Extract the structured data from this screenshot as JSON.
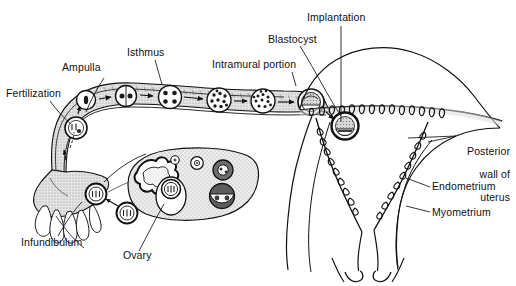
{
  "figure": {
    "background_color": "#ffffff",
    "ink_color": "#111111",
    "tissue_fill": "#e8e8e8",
    "width": 516,
    "height": 286
  },
  "labels": {
    "fertilization": "Fertilization",
    "ampulla": "Ampulla",
    "isthmus": "Isthmus",
    "intramural_portion": "Intramural portion",
    "blastocyst": "Blastocyst",
    "implantation": "Implantation",
    "posterior_wall_of_uterus": "Posterior\nwall of\nuterus",
    "posterior_wall_line1": "Posterior",
    "posterior_wall_line2": "wall of",
    "posterior_wall_line3": "uterus",
    "endometrium": "Endometrium",
    "myometrium": "Myometrium",
    "infundibulum": "Infundibulum",
    "ovary": "Ovary"
  },
  "structures": {
    "fallopian_tube": "fallopian-tube",
    "uterus": "uterus",
    "ovary": "ovary",
    "infundibulum_fimbriae": "infundibulum-fimbriae",
    "endometrial_glands": "endometrial-glands",
    "cervical_canal": "cervical-canal"
  },
  "embryo_stages": [
    {
      "name": "zygote",
      "cells": 1,
      "x": 82,
      "y": 99,
      "r": 9
    },
    {
      "name": "two-cell-stage",
      "cells": 2,
      "x": 124,
      "y": 96,
      "r": 10
    },
    {
      "name": "four-cell-stage",
      "cells": 4,
      "x": 168,
      "y": 97,
      "r": 11
    },
    {
      "name": "morula",
      "cells": 12,
      "x": 218,
      "y": 100,
      "r": 12
    },
    {
      "name": "late-morula",
      "cells": 16,
      "x": 262,
      "y": 101,
      "r": 12
    },
    {
      "name": "free-blastocyst",
      "cells": 0,
      "x": 310,
      "y": 102,
      "r": 13
    },
    {
      "name": "implanting-blastocyst",
      "cells": 0,
      "x": 345,
      "y": 125,
      "r": 13
    }
  ],
  "ovarian_features": [
    {
      "name": "primordial-follicle",
      "x": 175,
      "y": 160,
      "r": 4
    },
    {
      "name": "primary-follicle",
      "x": 196,
      "y": 164,
      "r": 6
    },
    {
      "name": "secondary-follicle",
      "x": 222,
      "y": 170,
      "r": 9
    },
    {
      "name": "graafian-follicle",
      "x": 171,
      "y": 196,
      "r": 13
    },
    {
      "name": "ruptured-follicle",
      "x": 221,
      "y": 196,
      "r": 12
    },
    {
      "name": "corpus-luteum",
      "x": 148,
      "y": 180,
      "r": 20
    },
    {
      "name": "ovum-released",
      "x": 96,
      "y": 194,
      "r": 10
    },
    {
      "name": "ovum-in-transit",
      "x": 126,
      "y": 212,
      "r": 10
    }
  ],
  "arrows": [
    {
      "name": "arrow-ovulation-to-fimbria",
      "from": [
        120,
        205
      ],
      "to": [
        102,
        198
      ]
    },
    {
      "name": "arrow-up-infundibulum",
      "from": [
        62,
        168
      ],
      "to": [
        58,
        150
      ]
    },
    {
      "name": "arrow-fertilization-up",
      "from": [
        72,
        128
      ],
      "to": [
        76,
        116
      ]
    },
    {
      "name": "arrow-stage-1-2",
      "from": [
        96,
        97
      ],
      "to": [
        112,
        96
      ]
    },
    {
      "name": "arrow-stage-2-3",
      "from": [
        140,
        95
      ],
      "to": [
        156,
        96
      ]
    },
    {
      "name": "arrow-stage-3-4",
      "from": [
        184,
        97
      ],
      "to": [
        202,
        99
      ]
    },
    {
      "name": "arrow-stage-4-5",
      "from": [
        236,
        101
      ],
      "to": [
        250,
        101
      ]
    },
    {
      "name": "arrow-stage-5-6",
      "from": [
        278,
        102
      ],
      "to": [
        294,
        102
      ]
    },
    {
      "name": "arrow-implantation",
      "from": [
        320,
        112
      ],
      "to": [
        336,
        121
      ]
    }
  ]
}
